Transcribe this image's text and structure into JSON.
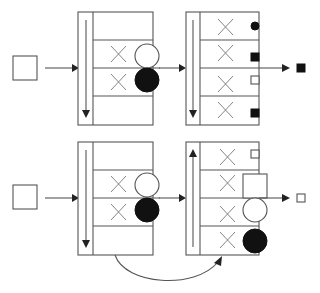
{
  "diagram": {
    "colors": {
      "stroke": "#555555",
      "filled": "#111111",
      "background": "#ffffff"
    },
    "rows": [
      {
        "name": "top",
        "input": {
          "shape": "square",
          "fill": "white"
        },
        "stage1": {
          "scan_direction": "down",
          "slots": [
            {
              "mark": "",
              "token": ""
            },
            {
              "mark": "x",
              "token": "circle-white"
            },
            {
              "mark": "x",
              "token": "circle-black"
            },
            {
              "mark": "",
              "token": ""
            }
          ]
        },
        "stage2": {
          "scan_direction": "down",
          "slots": [
            {
              "mark": "x",
              "token": "small-circle-black"
            },
            {
              "mark": "x",
              "token": "small-square-black"
            },
            {
              "mark": "x",
              "token": "small-square-white"
            },
            {
              "mark": "x",
              "token": "small-square-black"
            }
          ]
        },
        "output": {
          "shape": "square",
          "fill": "black"
        }
      },
      {
        "name": "bottom",
        "input": {
          "shape": "square",
          "fill": "white"
        },
        "stage1": {
          "scan_direction": "down",
          "slots": [
            {
              "mark": "",
              "token": ""
            },
            {
              "mark": "x",
              "token": "circle-white"
            },
            {
              "mark": "x",
              "token": "circle-black"
            },
            {
              "mark": "",
              "token": ""
            }
          ]
        },
        "stage2": {
          "scan_direction": "up",
          "slots": [
            {
              "mark": "x",
              "token": "small-square-white"
            },
            {
              "mark": "x",
              "token": "large-square-white"
            },
            {
              "mark": "x",
              "token": "large-circle-white"
            },
            {
              "mark": "x",
              "token": "large-circle-black"
            }
          ]
        },
        "output": {
          "shape": "square",
          "fill": "white"
        },
        "feedback_arrow": {
          "from": "stage1-bottom",
          "to": "stage2-bottom"
        }
      }
    ]
  }
}
